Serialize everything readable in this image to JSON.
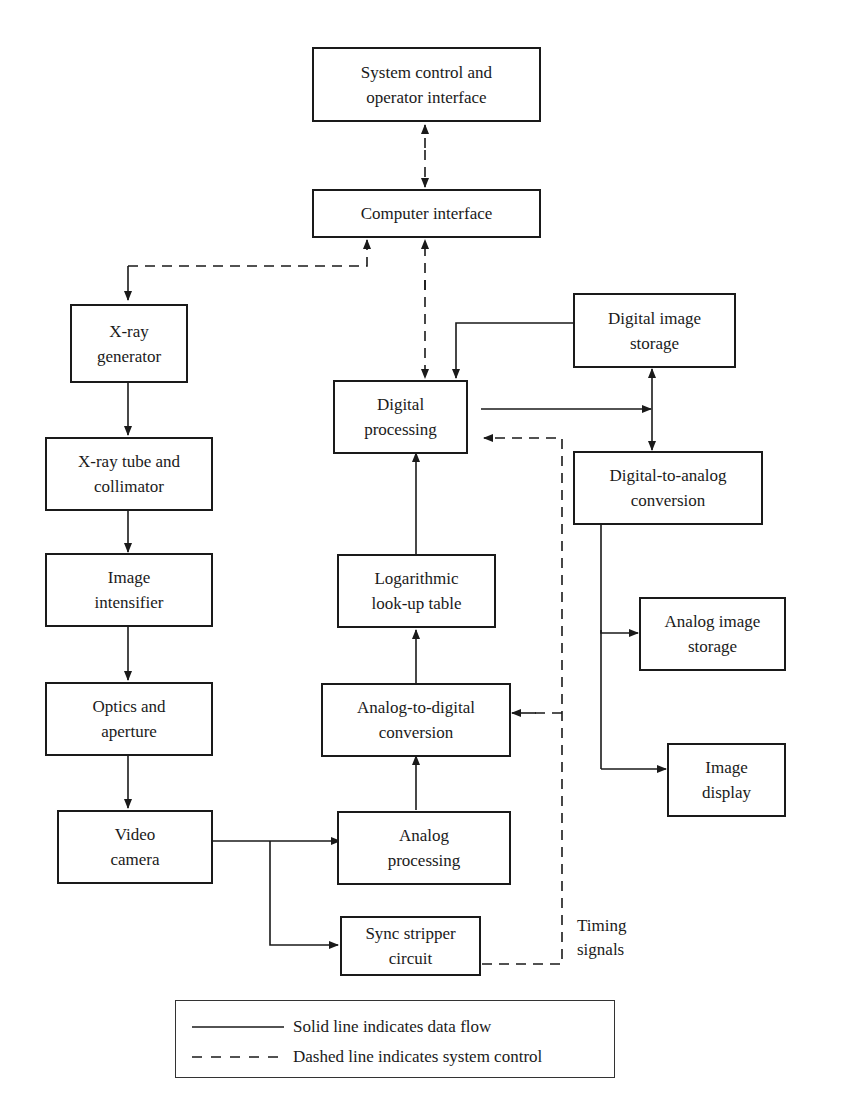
{
  "diagram": {
    "type": "block-diagram",
    "title": "",
    "nodes": {
      "system_control": {
        "label": "System control and\noperator interface"
      },
      "computer_interface": {
        "label": "Computer interface"
      },
      "xray_generator": {
        "label": "X-ray\ngenerator"
      },
      "xray_tube": {
        "label": "X-ray tube and\ncollimator"
      },
      "image_intensifier": {
        "label": "Image\nintensifier"
      },
      "optics": {
        "label": "Optics and\naperture"
      },
      "video_camera": {
        "label": "Video\ncamera"
      },
      "digital_processing": {
        "label": "Digital\nprocessing"
      },
      "log_lut": {
        "label": "Logarithmic\nlook-up table"
      },
      "adc": {
        "label": "Analog-to-digital\nconversion"
      },
      "analog_processing": {
        "label": "Analog\nprocessing"
      },
      "sync_stripper": {
        "label": "Sync stripper\ncircuit"
      },
      "digital_storage": {
        "label": "Digital image\nstorage"
      },
      "dac": {
        "label": "Digital-to-analog\nconversion"
      },
      "analog_storage": {
        "label": "Analog image\nstorage"
      },
      "image_display": {
        "label": "Image\ndisplay"
      }
    },
    "annotations": {
      "timing_signals": "Timing\nsignals"
    },
    "edges": [
      {
        "from": "system_control",
        "to": "computer_interface",
        "style": "dashed",
        "bidirectional": true
      },
      {
        "from": "computer_interface",
        "to": "xray_generator",
        "style": "dashed",
        "bidirectional": true
      },
      {
        "from": "computer_interface",
        "to": "digital_processing",
        "style": "dashed",
        "bidirectional": true
      },
      {
        "from": "xray_generator",
        "to": "xray_tube",
        "style": "solid"
      },
      {
        "from": "xray_tube",
        "to": "image_intensifier",
        "style": "solid"
      },
      {
        "from": "image_intensifier",
        "to": "optics",
        "style": "solid"
      },
      {
        "from": "optics",
        "to": "video_camera",
        "style": "solid"
      },
      {
        "from": "video_camera",
        "to": "analog_processing",
        "style": "solid"
      },
      {
        "from": "video_camera",
        "to": "sync_stripper",
        "style": "solid"
      },
      {
        "from": "analog_processing",
        "to": "adc",
        "style": "solid"
      },
      {
        "from": "adc",
        "to": "log_lut",
        "style": "solid"
      },
      {
        "from": "log_lut",
        "to": "digital_processing",
        "style": "solid"
      },
      {
        "from": "digital_storage",
        "to": "digital_processing",
        "style": "solid"
      },
      {
        "from": "digital_processing",
        "to": "digital_storage",
        "style": "solid"
      },
      {
        "from": "digital_processing",
        "to": "dac",
        "style": "solid"
      },
      {
        "from": "digital_storage",
        "to": "dac",
        "style": "solid",
        "bidirectional": true
      },
      {
        "from": "dac",
        "to": "analog_storage",
        "style": "solid"
      },
      {
        "from": "dac",
        "to": "image_display",
        "style": "solid"
      },
      {
        "from": "sync_stripper",
        "to": "adc",
        "style": "dashed",
        "label": "Timing signals"
      },
      {
        "from": "sync_stripper",
        "to": "digital_processing",
        "style": "dashed"
      }
    ],
    "legend": {
      "solid": "Solid line indicates data flow",
      "dashed": "Dashed line indicates system control"
    },
    "colors": {
      "line": "#1a1a1a",
      "background": "#ffffff"
    }
  }
}
